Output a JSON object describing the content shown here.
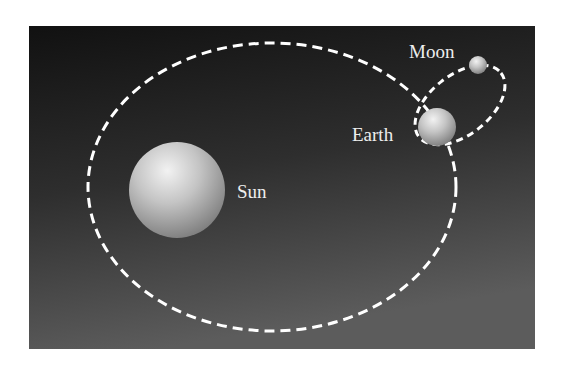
{
  "diagram": {
    "background": {
      "gradient_top": "#111111",
      "gradient_bottom": "#5a5a5a"
    },
    "orbit_color": "#ffffff",
    "bodies": [
      {
        "id": "sun",
        "label": "Sun"
      },
      {
        "id": "earth",
        "label": "Earth"
      },
      {
        "id": "moon",
        "label": "Moon"
      }
    ],
    "orbits": [
      {
        "id": "earth-orbit",
        "around": "Sun",
        "style": "dashed"
      },
      {
        "id": "moon-orbit",
        "around": "Earth",
        "style": "dashed"
      }
    ]
  }
}
